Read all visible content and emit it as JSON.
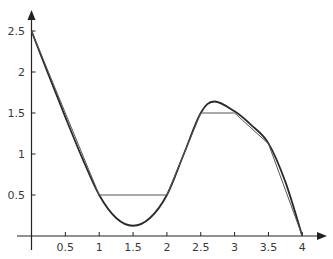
{
  "chart_data": {
    "type": "line",
    "title": "",
    "xlabel": "",
    "ylabel": "",
    "xlim": [
      0,
      4
    ],
    "ylim": [
      0,
      2.5
    ],
    "grid": false,
    "legend": null,
    "x_ticks": [
      0.5,
      1,
      1.5,
      2,
      2.5,
      3,
      3.5,
      4
    ],
    "x_tick_labels": [
      "0.5",
      "1",
      "1.5",
      "2",
      "2.5",
      "3",
      "3.5",
      "4"
    ],
    "y_ticks": [
      0.5,
      1,
      1.5,
      2,
      2.5
    ],
    "y_tick_labels": [
      "0.5",
      "1",
      "1.5",
      "2",
      "2.5"
    ],
    "series": [
      {
        "name": "smooth curve f(x)",
        "style": "smooth",
        "x": [
          0,
          0.25,
          0.5,
          0.75,
          1,
          1.25,
          1.5,
          1.75,
          2,
          2.25,
          2.5,
          2.7,
          3,
          3.25,
          3.5,
          3.75,
          4
        ],
        "y": [
          2.5,
          1.97,
          1.45,
          0.95,
          0.5,
          0.22,
          0.125,
          0.22,
          0.5,
          1.0,
          1.5,
          1.64,
          1.52,
          1.35,
          1.13,
          0.66,
          0
        ]
      },
      {
        "name": "piecewise linear approximation",
        "style": "linear",
        "x": [
          0,
          1,
          2,
          2.5,
          3,
          3.5,
          4
        ],
        "y": [
          2.5,
          0.5,
          0.5,
          1.5,
          1.5,
          1.125,
          0
        ]
      }
    ],
    "colors": {
      "axis": "#222222",
      "curve": "#2a2a2a",
      "approx": "#555555",
      "labels": "#3a3a3a"
    }
  }
}
